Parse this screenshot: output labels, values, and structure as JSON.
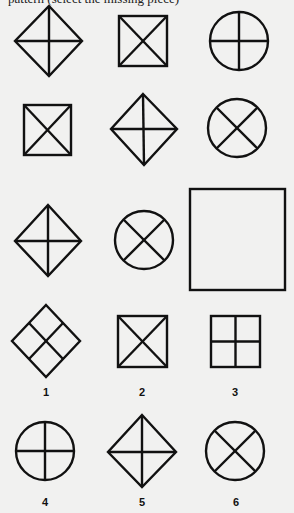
{
  "header": {
    "text": "pattern (select the missing piece)"
  },
  "puzzle": {
    "rows": [
      [
        "diamond-cross",
        "square-x",
        "circle-cross"
      ],
      [
        "square-x",
        "diamond-cross",
        "circle-x"
      ],
      [
        "diamond-cross",
        "circle-x",
        "missing-blank-square"
      ]
    ]
  },
  "options": [
    {
      "label": "1",
      "shape": "diamond-grid"
    },
    {
      "label": "2",
      "shape": "square-x"
    },
    {
      "label": "3",
      "shape": "square-cross"
    },
    {
      "label": "4",
      "shape": "circle-cross"
    },
    {
      "label": "5",
      "shape": "diamond-cross"
    },
    {
      "label": "6",
      "shape": "circle-x"
    }
  ],
  "colors": {
    "background": "#f1f1f0",
    "stroke": "#111111"
  }
}
